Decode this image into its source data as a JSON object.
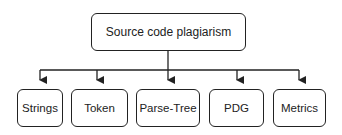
{
  "diagram": {
    "type": "tree",
    "root": {
      "label": "Source code plagiarism"
    },
    "children": [
      {
        "label": "Strings"
      },
      {
        "label": "Token"
      },
      {
        "label": "Parse-Tree"
      },
      {
        "label": "PDG"
      },
      {
        "label": "Metrics"
      }
    ],
    "colors": {
      "stroke": "#222222",
      "fill": "#ffffff",
      "text": "#222222"
    }
  }
}
